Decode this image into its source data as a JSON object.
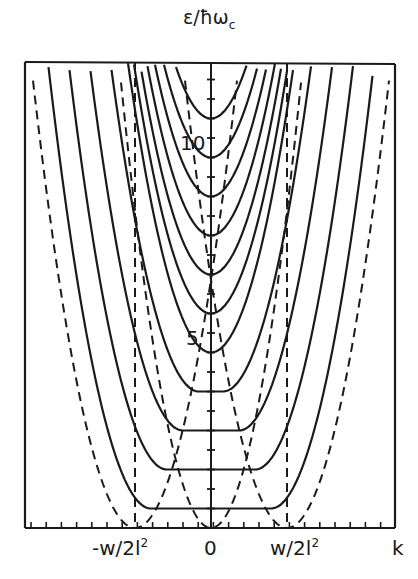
{
  "chart_data": {
    "type": "line",
    "title": "",
    "ylabel": "ε/ħω_c",
    "xlabel": "k",
    "x_tick_labels": [
      "-w/2l²",
      "0",
      "w/2l²",
      "k"
    ],
    "y_tick_labels": [
      "5",
      "10"
    ],
    "ylim": [
      0,
      11.9
    ],
    "grid": false,
    "legend": null,
    "series": [
      {
        "name": "Landau level n=0",
        "style": "solid",
        "min_energy": 0.5
      },
      {
        "name": "Landau level n=1",
        "style": "solid",
        "min_energy": 1.5
      },
      {
        "name": "Landau level n=2",
        "style": "solid",
        "min_energy": 2.5
      },
      {
        "name": "Landau level n=3",
        "style": "solid",
        "min_energy": 3.5
      },
      {
        "name": "Landau level n=4",
        "style": "solid",
        "min_energy": 4.5
      },
      {
        "name": "Landau level n=5",
        "style": "solid",
        "min_energy": 5.5
      },
      {
        "name": "Landau level n=6",
        "style": "solid",
        "min_energy": 6.5
      },
      {
        "name": "Landau level n=7",
        "style": "solid",
        "min_energy": 7.5
      },
      {
        "name": "Landau level n=8",
        "style": "solid",
        "min_energy": 8.5
      },
      {
        "name": "Landau level n=9",
        "style": "solid",
        "min_energy": 9.5
      },
      {
        "name": "Landau level n=10",
        "style": "solid",
        "min_energy": 10.5
      },
      {
        "name": "central dashed parabola",
        "style": "dashed",
        "vertex_k": 0,
        "vertex_energy": 0
      },
      {
        "name": "left dashed parabola",
        "style": "dashed",
        "vertex_k": "-w/2l²",
        "vertex_energy": 0
      },
      {
        "name": "right dashed parabola",
        "style": "dashed",
        "vertex_k": "w/2l²",
        "vertex_energy": 0
      },
      {
        "name": "vertical dashed line left",
        "style": "dashed",
        "k": "-w/2l²"
      },
      {
        "name": "vertical dashed line right",
        "style": "dashed",
        "k": "w/2l²"
      }
    ],
    "annotations": [
      "5",
      "10"
    ]
  },
  "labels": {
    "ylabel_main": "ε/ħω",
    "ylabel_sub": "c",
    "x_neg": "-w/2l",
    "x_neg_sup": "2",
    "x_zero": "0",
    "x_pos": "w/2l",
    "x_pos_sup": "2",
    "x_axis": "k",
    "y_five": "5",
    "y_ten": "10"
  },
  "colors": {
    "ink": "#1a1a1a",
    "background": "#ffffff"
  }
}
